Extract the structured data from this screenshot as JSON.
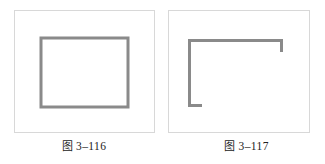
{
  "page": {
    "background_color": "#ffffff",
    "width": 325,
    "height": 164
  },
  "style": {
    "stroke_color": "#8a8a8a",
    "stroke_width": 3,
    "panel_border_color": "#d8d8d8",
    "panel_fill_color": "#ffffff",
    "caption_color": "#222222"
  },
  "figures": [
    {
      "id": "figure-3-116",
      "caption_cjk": "图",
      "caption_number": "3–116",
      "caption_full": "图 3–116",
      "drawing": {
        "type": "closed-rectangle",
        "description": "complete rectangular outline",
        "rect": {
          "x": 26,
          "y": 27,
          "width": 87,
          "height": 69
        }
      }
    },
    {
      "id": "figure-3-117",
      "caption_cjk": "图",
      "caption_number": "3–117",
      "caption_full": "图 3–117",
      "drawing": {
        "type": "open-bracket",
        "description": "incomplete rectangle: full top edge, full left edge, short downward stub at top-right, short rightward stub at bottom-left",
        "path": "M 19 96 L 19 28 L 114 28 L 114 39 M 19 96 L 32 96",
        "top_edge": {
          "x1": 19,
          "y1": 28,
          "x2": 114,
          "y2": 28
        },
        "left_edge": {
          "x1": 19,
          "y1": 28,
          "x2": 19,
          "y2": 96
        },
        "right_stub": {
          "x1": 114,
          "y1": 28,
          "x2": 114,
          "y2": 39
        },
        "bottom_stub": {
          "x1": 19,
          "y1": 96,
          "x2": 32,
          "y2": 96
        }
      }
    }
  ]
}
